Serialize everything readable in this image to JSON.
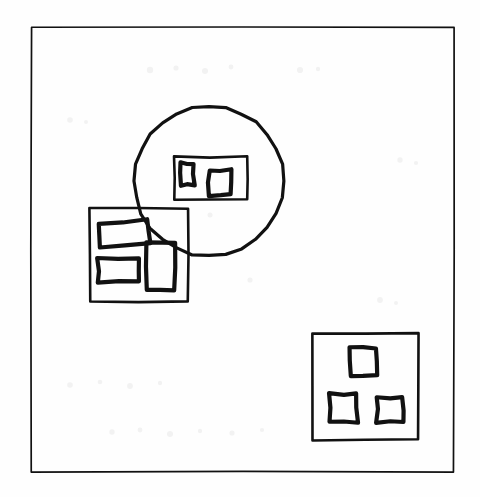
{
  "image": {
    "title": "Hand-drawn shapes diagram",
    "description": "A scanned hand-drawn line sketch: a thin rectangular border frame encloses three clusters of shapes — a large circle containing a rectangle with two small rectangles inside, an overlapping square containing three rectangles, and a lower-right square containing three small squares.",
    "style": "hand-drawn ink sketch on white paper, scanned",
    "width": 480,
    "height": 497,
    "background_color": "#fefefe",
    "ink_color": "#111111"
  },
  "chart_data": {
    "type": "diagram",
    "shape_count": 13,
    "shapes": [
      {
        "id": "page-frame",
        "name": "page-frame",
        "kind": "rectangle",
        "role": "outer border frame",
        "x": 31,
        "y": 27,
        "width": 423,
        "height": 445,
        "stroke_width": 1.7,
        "fill": "none"
      },
      {
        "id": "circle-group",
        "name": "circle-group",
        "kind": "circle",
        "role": "large circle outline, overlaps the left square group",
        "cx": 209,
        "cy": 181,
        "r": 75,
        "stroke_width": 3.2,
        "fill": "none"
      },
      {
        "id": "circle-inner-rect",
        "name": "circle-inner-rect",
        "kind": "rectangle",
        "role": "rectangle drawn inside the circle",
        "x": 174,
        "y": 157,
        "width": 73,
        "height": 43,
        "stroke_width": 2.6,
        "fill": "none"
      },
      {
        "id": "circle-inner-rect-small-1",
        "name": "circle-inner-rect-small-1",
        "kind": "rectangle",
        "role": "tall small rectangle, left side inside circle rectangle",
        "x": 180,
        "y": 163,
        "width": 14,
        "height": 22,
        "stroke_width": 4.2,
        "fill": "none"
      },
      {
        "id": "circle-inner-rect-small-2",
        "name": "circle-inner-rect-small-2",
        "kind": "rectangle",
        "role": "small square, right side inside circle rectangle",
        "x": 209,
        "y": 170,
        "width": 22,
        "height": 25,
        "stroke_width": 4.2,
        "fill": "none"
      },
      {
        "id": "left-square-group",
        "name": "left-square-group",
        "kind": "square",
        "role": "square outline overlapping the circle from lower-left",
        "x": 90,
        "y": 208,
        "width": 98,
        "height": 94,
        "stroke_width": 2.6,
        "fill": "none"
      },
      {
        "id": "left-square-rect-top",
        "name": "left-square-rect-top",
        "kind": "rectangle",
        "role": "tilted wide rectangle, upper area of left square",
        "x": 99,
        "y": 222,
        "width": 50,
        "height": 23,
        "rotation_deg": -5,
        "stroke_width": 4.2,
        "fill": "none"
      },
      {
        "id": "left-square-rect-bottom",
        "name": "left-square-rect-bottom",
        "kind": "rectangle",
        "role": "wide rectangle, lower-left area of left square",
        "x": 98,
        "y": 259,
        "width": 40,
        "height": 23,
        "stroke_width": 4.2,
        "fill": "none"
      },
      {
        "id": "left-square-rect-right",
        "name": "left-square-rect-right",
        "kind": "rectangle",
        "role": "tall rectangle, right side of left square, crosses the circle edge",
        "x": 147,
        "y": 243,
        "width": 28,
        "height": 47,
        "stroke_width": 4.2,
        "fill": "none"
      },
      {
        "id": "bottom-right-square-group",
        "name": "bottom-right-square-group",
        "kind": "square",
        "role": "square outline in the lower-right of the frame",
        "x": 312,
        "y": 333,
        "width": 106,
        "height": 107,
        "stroke_width": 2.6,
        "fill": "none"
      },
      {
        "id": "bottom-right-small-square-top",
        "name": "bottom-right-small-square-top",
        "kind": "square",
        "role": "small square, top centre of lower-right square",
        "x": 350,
        "y": 348,
        "width": 27,
        "height": 27,
        "stroke_width": 4.2,
        "fill": "none"
      },
      {
        "id": "bottom-right-small-square-left",
        "name": "bottom-right-small-square-left",
        "kind": "square",
        "role": "small square, lower-left of lower-right square",
        "x": 330,
        "y": 394,
        "width": 27,
        "height": 28,
        "stroke_width": 4.2,
        "fill": "none"
      },
      {
        "id": "bottom-right-small-square-right",
        "name": "bottom-right-small-square-right",
        "kind": "square",
        "role": "small square, lower-right of lower-right square",
        "x": 377,
        "y": 398,
        "width": 26,
        "height": 24,
        "stroke_width": 4.2,
        "fill": "none"
      }
    ],
    "groups": [
      {
        "name": "circle-cluster",
        "container": "circle-group",
        "members": 3
      },
      {
        "name": "left-square-cluster",
        "container": "left-square-group",
        "members": 3
      },
      {
        "name": "bottom-right-square-cluster",
        "container": "bottom-right-square-group",
        "members": 3
      }
    ]
  }
}
